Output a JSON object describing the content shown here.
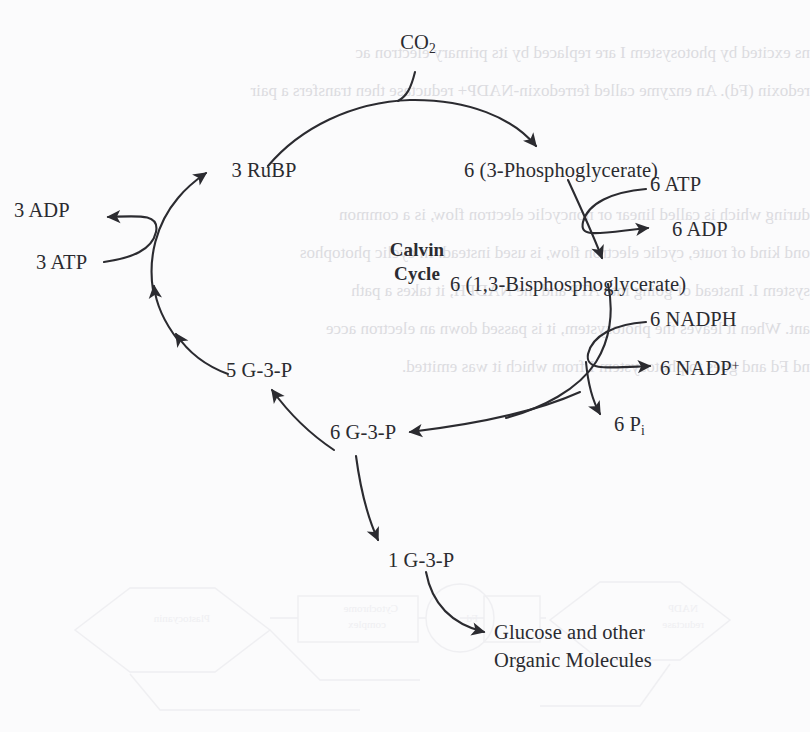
{
  "page": {
    "background_color": "#fbfbfc",
    "ink_color": "#2b2b30",
    "bleed_color": "#d2d2d7"
  },
  "diagram": {
    "title": "Calvin Cycle",
    "title_line_1": "Calvin",
    "title_line_2": "Cycle",
    "type": "cycle-diagram",
    "nodes": [
      {
        "id": "co2",
        "label": "CO",
        "sub": "2",
        "role": "input",
        "x": 418,
        "y": 40
      },
      {
        "id": "pga",
        "label": "6 (3-Phosphoglycerate)",
        "role": "intermediate",
        "x": 492,
        "y": 155
      },
      {
        "id": "rubp",
        "label": "3 RuBP",
        "role": "intermediate",
        "x": 206,
        "y": 160
      },
      {
        "id": "bpg",
        "label": "6 (1,3-Bisphosphoglycerate)",
        "role": "intermediate",
        "x": 492,
        "y": 270
      },
      {
        "id": "g3p6",
        "label": "6 G-3-P",
        "role": "intermediate",
        "x": 342,
        "y": 440
      },
      {
        "id": "g3p5",
        "label": "5 G-3-P",
        "role": "intermediate",
        "x": 238,
        "y": 368
      },
      {
        "id": "g3p1",
        "label": "1 G-3-P",
        "role": "output",
        "x": 386,
        "y": 555
      },
      {
        "id": "glucose",
        "label_line_1": "Glucose and other",
        "label_line_2": "Organic Molecules",
        "role": "product",
        "x": 496,
        "y": 632
      }
    ],
    "cofactors": [
      {
        "id": "atp6",
        "label": "6 ATP",
        "x": 655,
        "y": 183,
        "direction": "in"
      },
      {
        "id": "adp6",
        "label": "6 ADP",
        "x": 675,
        "y": 228,
        "direction": "out"
      },
      {
        "id": "nadph6",
        "label": "6 NADPH",
        "x": 655,
        "y": 318,
        "direction": "in"
      },
      {
        "id": "nadp6",
        "label": "6 NADP",
        "sup": "+",
        "x": 666,
        "y": 368,
        "direction": "out"
      },
      {
        "id": "pi6",
        "label": "6 P",
        "sub": "i",
        "x": 618,
        "y": 420,
        "direction": "out"
      },
      {
        "id": "adp3",
        "label": "3 ADP",
        "x": 14,
        "y": 208,
        "direction": "out"
      },
      {
        "id": "atp3",
        "label": "3 ATP",
        "x": 36,
        "y": 260,
        "direction": "in"
      }
    ]
  },
  "bleed_through": {
    "note": "Faint mirrored text showing through from the reverse side of the printed page",
    "lines": [
      "ns excited by photosystem I are replaced by its primary electron ac",
      "redoxin (Fd). An enzyme called ferredoxin-NADP+ reductase then transfers a pair",
      "of a pair of protons from the stroma, reducing it to NADPH. Note that",
      "in the stroma.",
      "during which is called linear or noncyclic electron flow, is a common",
      "ond kind of route, cyclic electron flow, is used instead. In cyclic photophos",
      "system I. Instead of going into ATP and the NADPH, it takes a path",
      "ant. When it leaves the photosystem, it is passed down an electron acce",
      "nd Fd and goes to photosystem I from which it was emitted."
    ]
  }
}
